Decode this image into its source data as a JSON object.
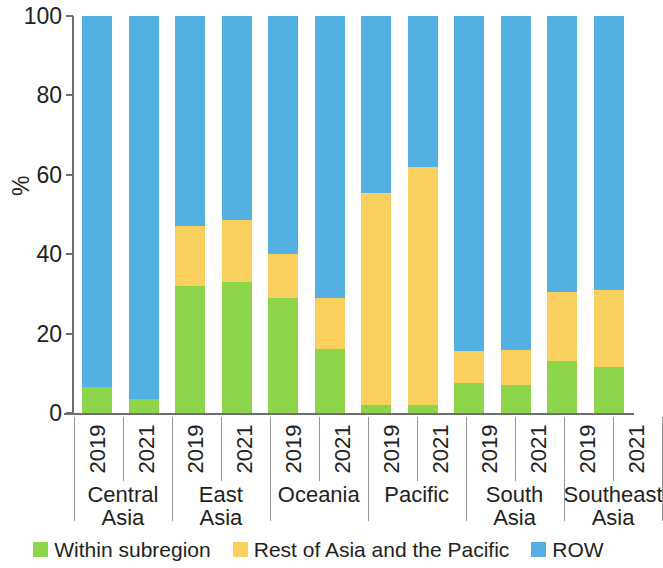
{
  "chart_data": {
    "type": "bar",
    "subtype": "stacked-bar-100-percent",
    "title": "",
    "xlabel": "",
    "ylabel": "%",
    "ylim": [
      0,
      100
    ],
    "yticks": [
      0,
      20,
      40,
      60,
      80,
      100
    ],
    "grid": false,
    "legend_position": "bottom",
    "stack_order_bottom_to_top": [
      "Within subregion",
      "Rest of Asia and the Pacific",
      "ROW"
    ],
    "colors": {
      "within_subregion": "#8CD44A",
      "rest_of_asia_pacific": "#F9CF5E",
      "row": "#54AFE2",
      "axis": "#6d6e71",
      "text": "#231f20",
      "separator": "#939598"
    },
    "groups": [
      "Central Asia",
      "East Asia",
      "Oceania",
      "Pacific",
      "South Asia",
      "Southeast Asia"
    ],
    "years": [
      "2019",
      "2021"
    ],
    "categories": [
      "Central Asia 2019",
      "Central Asia 2021",
      "East Asia 2019",
      "East Asia 2021",
      "Oceania 2019",
      "Oceania 2021",
      "Pacific 2019",
      "Pacific 2021",
      "South Asia 2019",
      "South Asia 2021",
      "Southeast Asia 2019",
      "Southeast Asia 2021"
    ],
    "series": [
      {
        "name": "Within subregion",
        "color": "#8CD44A",
        "values": [
          6.5,
          3.5,
          32.0,
          33.0,
          29.0,
          16.0,
          2.0,
          2.0,
          7.5,
          7.0,
          13.0,
          11.5
        ]
      },
      {
        "name": "Rest of Asia and the Pacific",
        "color": "#F9CF5E",
        "values": [
          0.0,
          0.0,
          15.0,
          15.5,
          11.0,
          13.0,
          53.5,
          60.0,
          8.0,
          9.0,
          17.5,
          19.5
        ]
      },
      {
        "name": "ROW",
        "color": "#54AFE2",
        "values": [
          93.5,
          96.5,
          53.0,
          51.5,
          60.0,
          71.0,
          44.5,
          38.0,
          84.5,
          84.0,
          69.5,
          69.0
        ]
      }
    ]
  },
  "axis": {
    "y_label": "%",
    "y_ticks": [
      "0",
      "20",
      "40",
      "60",
      "80",
      "100"
    ]
  },
  "x_groups": [
    {
      "name": "Central Asia",
      "years": [
        "2019",
        "2021"
      ]
    },
    {
      "name": "East Asia",
      "years": [
        "2019",
        "2021"
      ]
    },
    {
      "name": "Oceania",
      "years": [
        "2019",
        "2021"
      ]
    },
    {
      "name": "Pacific",
      "years": [
        "2019",
        "2021"
      ]
    },
    {
      "name": "South Asia",
      "years": [
        "2019",
        "2021"
      ]
    },
    {
      "name": "Southeast Asia",
      "years": [
        "2019",
        "2021"
      ]
    }
  ],
  "legend": {
    "items": [
      {
        "label": "Within subregion",
        "color": "#8CD44A"
      },
      {
        "label": "Rest of Asia and the Pacific",
        "color": "#F9CF5E"
      },
      {
        "label": "ROW",
        "color": "#54AFE2"
      }
    ]
  }
}
